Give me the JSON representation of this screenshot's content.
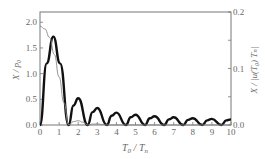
{
  "chart_data": {
    "type": "line",
    "title": "",
    "xlabel": "T0 / Tn",
    "ylabel": "X / p0",
    "ylabel_right": "X / |u(T0) Tn|",
    "xlim": [
      0,
      10
    ],
    "ylim": [
      0,
      2.2
    ],
    "ylim_right": [
      0,
      0.2
    ],
    "x_ticks": [
      "0",
      "1",
      "2",
      "3",
      "4",
      "5",
      "6",
      "7",
      "8",
      "9",
      "10"
    ],
    "y_ticks": [
      "0.0",
      "0.5",
      "1.0",
      "1.5",
      "2.0"
    ],
    "y_ticks_right": [
      "0.0",
      "0.1",
      "0.2"
    ],
    "grid": false,
    "legend": null,
    "series": [
      {
        "name": "X/p0 (thick, left axis)",
        "style": "thick",
        "x": [
          0,
          0.35,
          0.7,
          1.05,
          1.5,
          1.75,
          2.0,
          2.5,
          2.75,
          3.0,
          3.5,
          3.75,
          4.0,
          4.5,
          4.75,
          5.0,
          5.5,
          5.75,
          6.0,
          6.5,
          6.75,
          7.0,
          7.5,
          7.75,
          8.0,
          8.5,
          8.75,
          9.0,
          9.5,
          9.75,
          10.0
        ],
        "y": [
          0,
          1.2,
          1.72,
          1.2,
          0,
          0.38,
          0.52,
          0,
          0.25,
          0.33,
          0,
          0.18,
          0.24,
          0,
          0.15,
          0.2,
          0,
          0.13,
          0.17,
          0,
          0.11,
          0.15,
          0,
          0.1,
          0.13,
          0,
          0.09,
          0.12,
          0,
          0.09,
          0.11
        ]
      },
      {
        "name": "X/|u(T0)Tn| (thin, right axis)",
        "style": "thin",
        "x": [
          0,
          0.25,
          0.5,
          0.75,
          1.0,
          1.25,
          1.5,
          1.75,
          2.0,
          2.25,
          2.5,
          2.75,
          3.0,
          3.25,
          3.5,
          4.0,
          10.0
        ],
        "y": [
          0.175,
          0.17,
          0.155,
          0.125,
          0.085,
          0.04,
          0.0,
          0.006,
          0.0075,
          0.005,
          0.0,
          0.0015,
          0.002,
          0.001,
          0.0,
          0.0,
          0.0
        ]
      }
    ]
  },
  "axes": {
    "x_label_main": "T",
    "x_label_sub1": "0",
    "x_label_sep": " / ",
    "x_label_main2": "T",
    "x_label_sub2": "n",
    "y_left_label": "X / p₀",
    "y_right_label": "X / |u(T₀) Tₙ|"
  }
}
